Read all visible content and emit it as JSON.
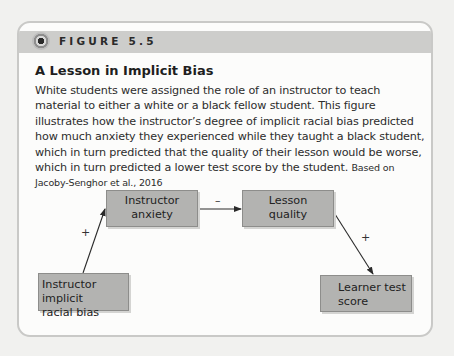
{
  "figure": {
    "label": "FIGURE 5.5",
    "icon": "target-circle-icon",
    "title": "A Lesson in Implicit Bias",
    "caption": "White students were assigned the role of an instructor to teach material to either a white or a black fellow student. This figure illustrates how the instructor’s degree of implicit racial bias predicted how much anxiety they experienced while they taught a black student, which in turn predicted that the quality of their lesson would be worse, which in turn predicted a lower test score by the student.",
    "citation": "Based on Jacoby-Senghor et al., 2016"
  },
  "diagram": {
    "nodes": {
      "bias": {
        "line1": "Instructor implicit",
        "line2": "racial bias"
      },
      "anxiety": {
        "line1": "Instructor",
        "line2": "anxiety"
      },
      "quality": {
        "line1": "Lesson",
        "line2": "quality"
      },
      "score": {
        "line1": "Learner test",
        "line2": "score"
      }
    },
    "edges": [
      {
        "from": "bias",
        "to": "anxiety",
        "sign": "+"
      },
      {
        "from": "anxiety",
        "to": "quality",
        "sign": "–"
      },
      {
        "from": "quality",
        "to": "score",
        "sign": "+"
      }
    ]
  }
}
